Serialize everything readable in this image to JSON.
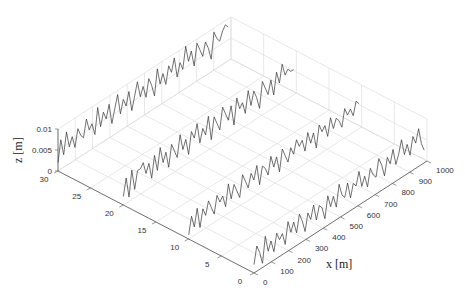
{
  "chart_data": {
    "type": "line",
    "subtype": "3d-waterfall",
    "title": "",
    "xlabel": "x [m]",
    "ylabel": "",
    "zlabel": "z [m]",
    "xlim": [
      0,
      1000
    ],
    "ylim": [
      0,
      30
    ],
    "zlim": [
      0,
      0.01
    ],
    "x_ticks": [
      "0",
      "100",
      "200",
      "300",
      "400",
      "500",
      "600",
      "700",
      "800",
      "900",
      "1000"
    ],
    "y_ticks": [
      "0",
      "5",
      "10",
      "15",
      "20",
      "25",
      "30"
    ],
    "z_ticks": [
      "0",
      "0.005",
      "0.01"
    ],
    "grid": true,
    "series": [
      {
        "name": "profile y=30",
        "y": 30,
        "x_step": 16.4,
        "values": [
          0.002,
          0.007,
          0.003,
          0.008,
          0.004,
          0.006,
          0.003,
          0.007,
          0.005,
          0.004,
          0.008,
          0.005,
          0.006,
          0.003,
          0.009,
          0.004,
          0.007,
          0.005,
          0.008,
          0.003,
          0.006,
          0.009,
          0.004,
          0.007,
          0.005,
          0.008,
          0.003,
          0.006,
          0.009,
          0.005,
          0.007,
          0.004,
          0.008,
          0.006,
          0.003,
          0.009,
          0.005,
          0.007,
          0.004,
          0.008,
          0.006,
          0.009,
          0.004,
          0.007,
          0.005,
          0.01,
          0.006,
          0.008,
          0.004,
          0.009,
          0.007,
          0.005,
          0.008,
          0.006,
          0.003,
          0.009,
          0.007,
          0.006,
          0.008,
          0.009,
          0.008
        ]
      },
      {
        "name": "profile y=20",
        "y": 20,
        "x_step": 16.4,
        "values": [
          0.002,
          0.006,
          0.001,
          0.007,
          0.002,
          0.006,
          0.006,
          0.007,
          0.004,
          0.006,
          0.002,
          0.007,
          0.003,
          0.008,
          0.004,
          0.006,
          0.002,
          0.007,
          0.005,
          0.003,
          0.008,
          0.004,
          0.006,
          0.002,
          0.007,
          0.005,
          0.008,
          0.003,
          0.006,
          0.004,
          0.008,
          0.002,
          0.007,
          0.005,
          0.003,
          0.008,
          0.006,
          0.004,
          0.007,
          0.002,
          0.008,
          0.005,
          0.006,
          0.003,
          0.008,
          0.004,
          0.007,
          0.005,
          0.002,
          0.008,
          0.006,
          0.004,
          0.007,
          0.003,
          0.008,
          0.005,
          0.009,
          0.006,
          0.007,
          0.006,
          0.006
        ]
      },
      {
        "name": "profile y=10",
        "y": 10,
        "x_step": 16.4,
        "values": [
          0.001,
          0.005,
          0.002,
          0.006,
          0.001,
          0.005,
          0.003,
          0.006,
          0.004,
          0.002,
          0.006,
          0.004,
          0.005,
          0.002,
          0.007,
          0.003,
          0.006,
          0.004,
          0.002,
          0.007,
          0.005,
          0.003,
          0.006,
          0.004,
          0.007,
          0.002,
          0.006,
          0.005,
          0.003,
          0.007,
          0.004,
          0.006,
          0.002,
          0.007,
          0.005,
          0.003,
          0.006,
          0.004,
          0.007,
          0.005,
          0.006,
          0.003,
          0.007,
          0.004,
          0.006,
          0.002,
          0.007,
          0.005,
          0.006,
          0.003,
          0.007,
          0.004,
          0.006,
          0.005,
          0.003,
          0.007,
          0.005,
          0.006,
          0.004,
          0.007,
          0.006
        ]
      },
      {
        "name": "profile y=0",
        "y": 0,
        "x_step": 16.4,
        "values": [
          0.002,
          0.006,
          0.004,
          0.001,
          0.007,
          0.003,
          0.005,
          0.002,
          0.006,
          0.004,
          0.005,
          0.002,
          0.007,
          0.004,
          0.006,
          0.003,
          0.007,
          0.005,
          0.002,
          0.006,
          0.004,
          0.007,
          0.003,
          0.006,
          0.005,
          0.002,
          0.007,
          0.004,
          0.006,
          0.003,
          0.008,
          0.005,
          0.004,
          0.007,
          0.003,
          0.006,
          0.005,
          0.008,
          0.004,
          0.006,
          0.003,
          0.007,
          0.005,
          0.004,
          0.008,
          0.006,
          0.003,
          0.007,
          0.005,
          0.008,
          0.004,
          0.006,
          0.009,
          0.005,
          0.007,
          0.004,
          0.008,
          0.006,
          0.009,
          0.005,
          0.003
        ]
      }
    ],
    "colors": {
      "line": "#333333",
      "grid": "#d8d8d8",
      "axis": "#555555"
    }
  }
}
